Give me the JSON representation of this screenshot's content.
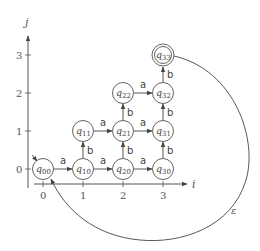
{
  "diagram": {
    "type": "finite-automaton-grid",
    "axes": {
      "x_label": "i",
      "y_label": "j",
      "x_ticks": [
        "0",
        "1",
        "2",
        "3"
      ],
      "y_ticks": [
        "0",
        "1",
        "2",
        "3"
      ]
    },
    "states": [
      {
        "id": "q00",
        "base": "q",
        "sub": "00",
        "i": 0,
        "j": 0,
        "initial": true,
        "accepting": false
      },
      {
        "id": "q10",
        "base": "q",
        "sub": "10",
        "i": 1,
        "j": 0,
        "initial": false,
        "accepting": false
      },
      {
        "id": "q20",
        "base": "q",
        "sub": "20",
        "i": 2,
        "j": 0,
        "initial": false,
        "accepting": false
      },
      {
        "id": "q30",
        "base": "q",
        "sub": "30",
        "i": 3,
        "j": 0,
        "initial": false,
        "accepting": false
      },
      {
        "id": "q11",
        "base": "q",
        "sub": "11",
        "i": 1,
        "j": 1,
        "initial": false,
        "accepting": false
      },
      {
        "id": "q21",
        "base": "q",
        "sub": "21",
        "i": 2,
        "j": 1,
        "initial": false,
        "accepting": false
      },
      {
        "id": "q31",
        "base": "q",
        "sub": "31",
        "i": 3,
        "j": 1,
        "initial": false,
        "accepting": false
      },
      {
        "id": "q22",
        "base": "q",
        "sub": "22",
        "i": 2,
        "j": 2,
        "initial": false,
        "accepting": false
      },
      {
        "id": "q32",
        "base": "q",
        "sub": "32",
        "i": 3,
        "j": 2,
        "initial": false,
        "accepting": false
      },
      {
        "id": "q33",
        "base": "q",
        "sub": "33",
        "i": 3,
        "j": 3,
        "initial": false,
        "accepting": true
      }
    ],
    "transitions": [
      {
        "from": "q00",
        "to": "q10",
        "label": "a"
      },
      {
        "from": "q10",
        "to": "q20",
        "label": "a"
      },
      {
        "from": "q20",
        "to": "q30",
        "label": "a"
      },
      {
        "from": "q11",
        "to": "q21",
        "label": "a"
      },
      {
        "from": "q21",
        "to": "q31",
        "label": "a"
      },
      {
        "from": "q22",
        "to": "q32",
        "label": "a"
      },
      {
        "from": "q10",
        "to": "q11",
        "label": "b"
      },
      {
        "from": "q20",
        "to": "q21",
        "label": "b"
      },
      {
        "from": "q21",
        "to": "q22",
        "label": "b"
      },
      {
        "from": "q30",
        "to": "q31",
        "label": "b"
      },
      {
        "from": "q31",
        "to": "q32",
        "label": "b"
      },
      {
        "from": "q32",
        "to": "q33",
        "label": "b"
      },
      {
        "from": "q33",
        "to": "q00",
        "label": "ε"
      }
    ]
  }
}
